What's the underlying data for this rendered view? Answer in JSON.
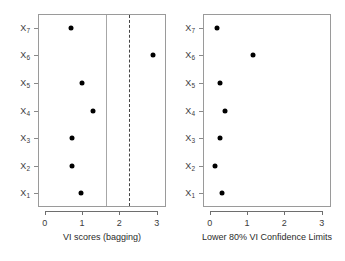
{
  "figure": {
    "panels": [
      {
        "id": "left",
        "xlabel": "VI scores (bagging)",
        "xticks": [
          "0",
          "1",
          "2",
          "3"
        ],
        "yticks": [
          "X",
          "X",
          "X",
          "X",
          "X",
          "X",
          "X"
        ]
      },
      {
        "id": "right",
        "xlabel": "Lower 80% VI Confidence Limits",
        "xticks": [
          "0",
          "1",
          "2",
          "3"
        ],
        "yticks": [
          "X",
          "X",
          "X",
          "X",
          "X",
          "X",
          "X"
        ]
      }
    ]
  },
  "chart_data": [
    {
      "type": "scatter",
      "title": "",
      "xlabel": "VI scores (bagging)",
      "ylabel": "",
      "xlim": [
        -0.18,
        3.25
      ],
      "ylim": [
        0.5,
        7.5
      ],
      "grid": false,
      "legend": null,
      "categories": [
        "X1",
        "X2",
        "X3",
        "X4",
        "X5",
        "X6",
        "X7"
      ],
      "ytick_labels": [
        "X₁",
        "X₂",
        "X₃",
        "X₄",
        "X₅",
        "X₆",
        "X₇"
      ],
      "xtick_values": [
        0,
        1,
        2,
        3
      ],
      "xtick_labels": [
        "0",
        "1",
        "2",
        "3"
      ],
      "values": [
        0.97,
        0.72,
        0.72,
        1.3,
        1.0,
        2.9,
        0.7
      ],
      "points": [
        {
          "label": "X₁",
          "x": 0.97,
          "y": 1
        },
        {
          "label": "X₂",
          "x": 0.72,
          "y": 2
        },
        {
          "label": "X₃",
          "x": 0.72,
          "y": 3
        },
        {
          "label": "X₄",
          "x": 1.3,
          "y": 4
        },
        {
          "label": "X₅",
          "x": 1.0,
          "y": 5
        },
        {
          "label": "X₆",
          "x": 2.9,
          "y": 6
        },
        {
          "label": "X₇",
          "x": 0.7,
          "y": 7
        }
      ],
      "annotations": [
        {
          "kind": "vline",
          "style": "solid",
          "x": 1.65,
          "color": "#a7a7a7"
        },
        {
          "kind": "vline",
          "style": "dashed",
          "x": 2.27,
          "color": "#444444"
        }
      ]
    },
    {
      "type": "scatter",
      "title": "",
      "xlabel": "Lower 80% VI Confidence Limits",
      "ylabel": "",
      "xlim": [
        -0.18,
        3.25
      ],
      "ylim": [
        0.5,
        7.5
      ],
      "grid": false,
      "legend": null,
      "categories": [
        "X1",
        "X2",
        "X3",
        "X4",
        "X5",
        "X6",
        "X7"
      ],
      "ytick_labels": [
        "X₁",
        "X₂",
        "X₃",
        "X₄",
        "X₅",
        "X₆",
        "X₇"
      ],
      "xtick_values": [
        0,
        1,
        2,
        3
      ],
      "xtick_labels": [
        "0",
        "1",
        "2",
        "3"
      ],
      "values": [
        0.33,
        0.13,
        0.28,
        0.42,
        0.28,
        1.15,
        0.2
      ],
      "points": [
        {
          "label": "X₁",
          "x": 0.33,
          "y": 1
        },
        {
          "label": "X₂",
          "x": 0.13,
          "y": 2
        },
        {
          "label": "X₃",
          "x": 0.28,
          "y": 3
        },
        {
          "label": "X₄",
          "x": 0.42,
          "y": 4
        },
        {
          "label": "X₅",
          "x": 0.28,
          "y": 5
        },
        {
          "label": "X₆",
          "x": 1.15,
          "y": 6
        },
        {
          "label": "X₇",
          "x": 0.2,
          "y": 7
        }
      ],
      "annotations": []
    }
  ]
}
